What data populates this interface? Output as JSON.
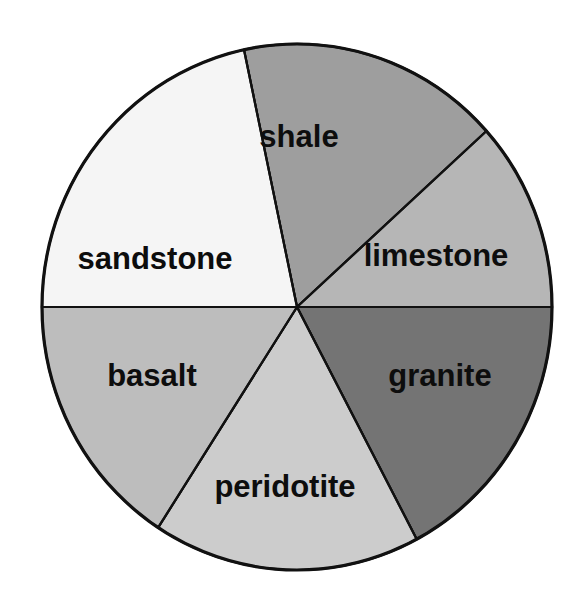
{
  "figure": {
    "kind": "pie-wheel-diagram",
    "background_color": "#ffffff",
    "outline_color": "#111111",
    "label_color": "#0d0d0d"
  },
  "chart_data": {
    "type": "pie",
    "title": "",
    "subtitle": "",
    "xlabel": "",
    "ylabel": "",
    "grid": false,
    "legend_position": "none",
    "labels_inside_slices": true,
    "center_x": 297,
    "center_y": 307,
    "radius_x": 255,
    "radius_y": 263,
    "start_angle_deg": -90,
    "total_slices": 6,
    "categories": [
      "shale",
      "limestone",
      "granite",
      "peridotite",
      "basalt",
      "sandstone"
    ],
    "values": [
      1,
      1,
      1,
      1,
      1,
      1
    ],
    "percentages": [
      "16.7%",
      "16.7%",
      "16.7%",
      "16.7%",
      "16.7%",
      "16.7%"
    ],
    "slice_angle_deg": 60,
    "slices": [
      {
        "label": "shale",
        "position": "top",
        "color": "#9e9e9e",
        "start_deg": -102,
        "end_deg": -42,
        "label_x": 299,
        "label_y": 139,
        "font_size": 31
      },
      {
        "label": "limestone",
        "position": "upper-right",
        "color": "#b6b6b6",
        "start_deg": -42,
        "end_deg": 0,
        "label_x": 436,
        "label_y": 258,
        "font_size": 31
      },
      {
        "label": "granite",
        "position": "lower-right",
        "color": "#747474",
        "start_deg": 0,
        "end_deg": 62,
        "label_x": 440,
        "label_y": 378,
        "font_size": 31
      },
      {
        "label": "peridotite",
        "position": "bottom",
        "color": "#cccccc",
        "start_deg": 62,
        "end_deg": 123,
        "label_x": 285,
        "label_y": 489,
        "font_size": 31
      },
      {
        "label": "basalt",
        "position": "lower-left",
        "color": "#bdbdbd",
        "start_deg": 123,
        "end_deg": 180,
        "label_x": 152,
        "label_y": 378,
        "font_size": 31
      },
      {
        "label": "sandstone",
        "position": "upper-left",
        "color": "#f5f5f5",
        "start_deg": 180,
        "end_deg": 258,
        "label_x": 155,
        "label_y": 261,
        "font_size": 31
      }
    ]
  }
}
